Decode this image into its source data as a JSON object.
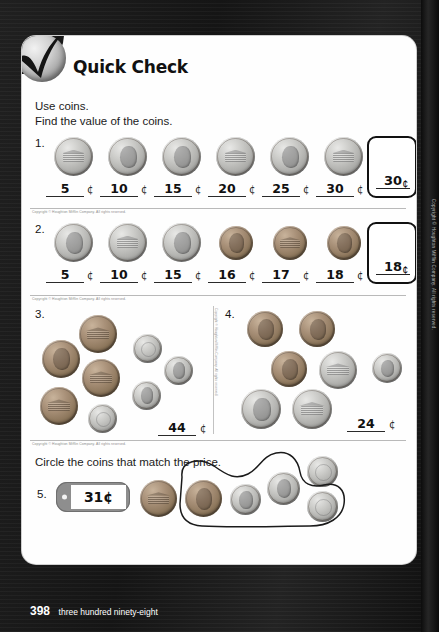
{
  "page": {
    "title": "Quick Check",
    "logo_icon": "checkmark-sphere-icon",
    "number": "398",
    "number_words": "three hundred ninety-eight",
    "copyright": "Copyright © Houghton Mifflin Company. All rights reserved.",
    "background_color": "#1c1c1c",
    "sheet_color": "#fefefe"
  },
  "instructions": {
    "line1": "Use coins.",
    "line2": "Find the value of the coins.",
    "section2": "Circle the coins that match the price."
  },
  "cent_symbol": "¢",
  "problems": [
    {
      "number": "1.",
      "coins": [
        "nickel",
        "nickel",
        "nickel",
        "nickel",
        "nickel",
        "nickel"
      ],
      "running_totals": [
        "5",
        "10",
        "15",
        "20",
        "25",
        "30"
      ],
      "answer": "30"
    },
    {
      "number": "2.",
      "coins": [
        "nickel",
        "nickel",
        "nickel",
        "penny",
        "penny",
        "penny"
      ],
      "running_totals": [
        "5",
        "10",
        "15",
        "16",
        "17",
        "18"
      ],
      "answer": "18"
    },
    {
      "number": "3.",
      "coins": [
        "penny",
        "penny",
        "penny",
        "penny",
        "dime",
        "dime",
        "dime",
        "dime"
      ],
      "answer": "44"
    },
    {
      "number": "4.",
      "coins": [
        "penny",
        "penny",
        "penny",
        "nickel",
        "nickel",
        "nickel",
        "dime"
      ],
      "answer": "24"
    },
    {
      "number": "5.",
      "price": "31¢",
      "coins": [
        "penny",
        "penny",
        "dime",
        "dime",
        "dime",
        "dime"
      ],
      "circled": "penny and three dimes"
    }
  ]
}
